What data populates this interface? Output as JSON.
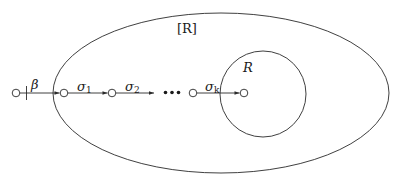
{
  "diagram": {
    "outer_region": {
      "label": "[R]",
      "center": [
        221,
        93
      ],
      "rx": 168,
      "ry": 80
    },
    "inner_region": {
      "label": "R",
      "center": [
        263,
        94
      ],
      "r": 43
    },
    "nodes": [
      {
        "id": "n0",
        "x": 16,
        "y": 93
      },
      {
        "id": "n1",
        "x": 64,
        "y": 93
      },
      {
        "id": "n2",
        "x": 112,
        "y": 93
      },
      {
        "id": "nk",
        "x": 193,
        "y": 93
      },
      {
        "id": "target",
        "x": 244,
        "y": 93
      }
    ],
    "edges": [
      {
        "from": "n0",
        "to": "n1",
        "label": "β",
        "has_tick": true
      },
      {
        "from": "n1",
        "to": "n2",
        "label_base": "σ",
        "label_sub": "1"
      },
      {
        "from": "n2",
        "to": "ellipsis",
        "label_base": "σ",
        "label_sub": "2"
      },
      {
        "from": "nk",
        "to": "target",
        "label_base": "σ",
        "label_sub": "k"
      }
    ],
    "ellipsis": "•••"
  }
}
